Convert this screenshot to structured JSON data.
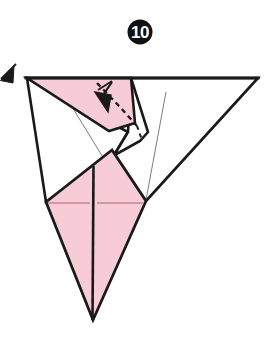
{
  "figure": {
    "kind": "origami-fold-diagram",
    "title_number": "10",
    "canvas": {
      "width": 271,
      "height": 355
    },
    "colors": {
      "paper_front": "#F8CCD6",
      "paper_back": "#FFFFFF",
      "ink": "#1A1A1A",
      "crease_light": "#6E6E6E",
      "crease_pink": "#C9848F",
      "badge_fill": "#111111",
      "badge_text": "#FFFFFF",
      "background": "#FFFFFF"
    },
    "step_badge": {
      "label": "10",
      "cx": 140,
      "cy": 32,
      "r": 12.5
    },
    "shapes": [
      {
        "name": "large-white-right-triangle",
        "fill": "#FFFFFF",
        "stroke": "#1A1A1A",
        "stroke_width": 2.6,
        "points": "27,78 258,78 146,201"
      },
      {
        "name": "upper-left-white-flap",
        "fill": "#FFFFFF",
        "stroke": "#1A1A1A",
        "stroke_width": 2.6,
        "points": "27,78 128,132 116,152 46,202"
      },
      {
        "name": "upper-pink-flap",
        "fill": "#F8CCD6",
        "stroke": "#1A1A1A",
        "stroke_width": 2.6,
        "points": "27,78 131,78 134,122 109,130"
      },
      {
        "name": "mid-white-wedge",
        "fill": "#FFFFFF",
        "stroke": "#1A1A1A",
        "stroke_width": 2.6,
        "points": "131,78 148,132 140,140 104,160 116,152 128,132"
      },
      {
        "name": "lower-pink-kite",
        "fill": "#F8CCD6",
        "stroke": "#1A1A1A",
        "stroke_width": 2.8,
        "points": "46,202 112,150 146,201 93,320"
      }
    ],
    "creases": [
      {
        "name": "crease-left-long",
        "kind": "valley-thin",
        "x1": 58,
        "y1": 84,
        "x2": 123,
        "y2": 190,
        "color": "#6E6E6E",
        "width": 0.9
      },
      {
        "name": "crease-right-long",
        "kind": "valley-thin",
        "x1": 164,
        "y1": 90,
        "x2": 146,
        "y2": 200,
        "color": "#6E6E6E",
        "width": 0.9
      },
      {
        "name": "crease-center-vertical",
        "kind": "mountain",
        "x1": 94,
        "y1": 168,
        "x2": 93,
        "y2": 320,
        "color": "#1A1A1A",
        "width": 2.4
      },
      {
        "name": "crease-horizontal-left",
        "kind": "pink-crease",
        "x1": 48,
        "y1": 203,
        "x2": 92,
        "y2": 203,
        "color": "#C9848F",
        "width": 1.2
      },
      {
        "name": "crease-horizontal-right",
        "kind": "pink-crease",
        "x1": 96,
        "y1": 203,
        "x2": 144,
        "y2": 203,
        "color": "#C9848F",
        "width": 1.2
      }
    ],
    "fold_lines_dashed": [
      {
        "name": "dashed-fold-line",
        "points": "98,84 118,105 136,124",
        "dash": "5 4",
        "color": "#1A1A1A",
        "width": 2.2
      }
    ],
    "dashed_edges": [
      {
        "name": "dashed-hidden-edge",
        "points": "134,122 140,140",
        "dash": "4 4",
        "color": "#1A1A1A",
        "width": 2.0
      }
    ],
    "arrows": [
      {
        "name": "fold-arrow-main",
        "tail_x": 112,
        "tail_y": 83,
        "head_x": 104,
        "head_y": 104,
        "description": "solid arrow pointing down-left into pink flap"
      },
      {
        "name": "fold-arrow-edge-left",
        "tail_x": 12,
        "tail_y": 70,
        "head_x": 1,
        "head_y": 80,
        "description": "partially cropped arrowhead at left border"
      }
    ],
    "tick_marks": [
      {
        "name": "arrow-cross-tick",
        "x1": 99,
        "y1": 90,
        "x2": 113,
        "y2": 82
      }
    ]
  }
}
